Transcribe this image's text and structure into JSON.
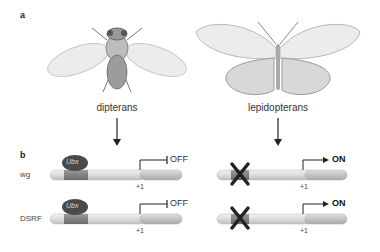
{
  "panels": {
    "a": {
      "label": "a",
      "left": {
        "caption": "dipterans",
        "image": "fly-illustration"
      },
      "right": {
        "caption": "lepidopterans",
        "image": "butterfly-illustration"
      }
    },
    "b": {
      "label": "b",
      "genes": [
        {
          "name": "wg",
          "left": {
            "factor": "Ubx",
            "state": "OFF",
            "tss": "+1"
          },
          "right": {
            "factor_blocked": true,
            "state": "ON",
            "tss": "+1"
          }
        },
        {
          "name": "DSRF",
          "left": {
            "factor": "Ubx",
            "state": "OFF",
            "tss": "+1"
          },
          "right": {
            "factor_blocked": true,
            "state": "ON",
            "tss": "+1"
          }
        }
      ]
    }
  },
  "colors": {
    "bar_light": "#e4e4e4",
    "bar_mid": "#c8c8c8",
    "site": "#8a8a8a",
    "ubx": "#4a4a4a",
    "cross": "#222222"
  }
}
